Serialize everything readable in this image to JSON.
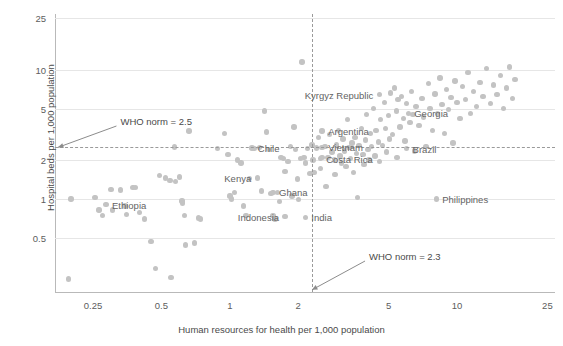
{
  "chart_data": {
    "type": "scatter",
    "title": "",
    "xlabel": "Human resources for health per 1,000 population",
    "ylabel": "Hospital beds per 1,000 population",
    "xscale": "log",
    "yscale": "log",
    "xlim": [
      0.17,
      27
    ],
    "ylim": [
      0.19,
      27
    ],
    "xticks": [
      "0.25",
      "0.5",
      "1",
      "2",
      "5",
      "10",
      "25"
    ],
    "xtick_values": [
      0.25,
      0.5,
      1,
      2,
      5,
      10,
      25
    ],
    "yticks": [
      "25",
      "10",
      "5",
      "2",
      "1",
      "0.5"
    ],
    "ytick_values": [
      25,
      10,
      5,
      2,
      1,
      0.5
    ],
    "grid": "horizontal",
    "legend": "none",
    "marker_color": "#c3c3c3",
    "text_color": "#5d5d5d",
    "gridline_color": "#e6e6e6",
    "reference_lines": [
      {
        "name": "who-norm-beds",
        "label": "WHO norm = 2.5",
        "orientation": "horizontal",
        "value": 2.5,
        "label_x": 0.33,
        "label_y": 4.0,
        "style": "dashed"
      },
      {
        "name": "who-norm-workers",
        "label": "WHO norm = 2.3",
        "orientation": "vertical",
        "value": 2.3,
        "label_x": 4.1,
        "label_y": 0.36,
        "style": "dashed"
      }
    ],
    "labeled_points": [
      {
        "name": "Kyrgyz Republic",
        "x": 4.55,
        "y": 6.4,
        "label_side": "left"
      },
      {
        "name": "Georgia",
        "x": 6.1,
        "y": 4.6,
        "label_side": "right"
      },
      {
        "name": "Argentina",
        "x": 2.55,
        "y": 3.35,
        "label_side": "right"
      },
      {
        "name": "Brazil",
        "x": 6.0,
        "y": 2.45,
        "label_side": "right"
      },
      {
        "name": "Chile",
        "x": 1.25,
        "y": 2.48,
        "label_side": "right"
      },
      {
        "name": "Vietnam",
        "x": 2.55,
        "y": 2.5,
        "label_side": "right"
      },
      {
        "name": "Costa Rica",
        "x": 2.5,
        "y": 2.05,
        "label_side": "right"
      },
      {
        "name": "Kenya",
        "x": 1.32,
        "y": 1.45,
        "label_side": "left"
      },
      {
        "name": "Ghana",
        "x": 1.55,
        "y": 1.12,
        "label_side": "right"
      },
      {
        "name": "Philippines",
        "x": 8.1,
        "y": 1.0,
        "label_side": "right"
      },
      {
        "name": "Ethiopia",
        "x": 0.285,
        "y": 0.9,
        "label_side": "right"
      },
      {
        "name": "Indonesia",
        "x": 1.75,
        "y": 0.73,
        "label_side": "left"
      },
      {
        "name": "India",
        "x": 2.15,
        "y": 0.72,
        "label_side": "right"
      }
    ],
    "points": [
      [
        0.195,
        0.24
      ],
      [
        0.2,
        1.0
      ],
      [
        0.255,
        1.02
      ],
      [
        0.265,
        0.82
      ],
      [
        0.275,
        0.74
      ],
      [
        0.3,
        1.18
      ],
      [
        0.305,
        0.82
      ],
      [
        0.33,
        1.17
      ],
      [
        0.345,
        0.88
      ],
      [
        0.35,
        0.76
      ],
      [
        0.375,
        1.23
      ],
      [
        0.385,
        1.23
      ],
      [
        0.4,
        0.78
      ],
      [
        0.42,
        0.7
      ],
      [
        0.45,
        0.47
      ],
      [
        0.47,
        0.29
      ],
      [
        0.49,
        1.52
      ],
      [
        0.52,
        1.45
      ],
      [
        0.545,
        1.38
      ],
      [
        0.55,
        0.245
      ],
      [
        0.57,
        2.52
      ],
      [
        0.575,
        1.36
      ],
      [
        0.6,
        1.48
      ],
      [
        0.615,
        0.96
      ],
      [
        0.62,
        0.93
      ],
      [
        0.63,
        0.74
      ],
      [
        0.64,
        0.44
      ],
      [
        0.66,
        3.35
      ],
      [
        0.7,
        0.455
      ],
      [
        0.73,
        0.71
      ],
      [
        0.745,
        0.7
      ],
      [
        0.88,
        2.45
      ],
      [
        0.95,
        3.2
      ],
      [
        0.98,
        2.2
      ],
      [
        1.0,
        1.05
      ],
      [
        1.02,
        1.0
      ],
      [
        1.05,
        1.12
      ],
      [
        1.08,
        2.0
      ],
      [
        1.12,
        1.9
      ],
      [
        1.15,
        0.88
      ],
      [
        1.18,
        0.74
      ],
      [
        1.22,
        1.44
      ],
      [
        1.28,
        2.45
      ],
      [
        1.35,
        2.5
      ],
      [
        1.38,
        1.15
      ],
      [
        1.42,
        4.8
      ],
      [
        1.45,
        3.3
      ],
      [
        1.48,
        2.42
      ],
      [
        1.52,
        1.1
      ],
      [
        1.55,
        0.74
      ],
      [
        1.58,
        0.7
      ],
      [
        1.62,
        1.12
      ],
      [
        1.65,
        0.95
      ],
      [
        1.68,
        2.1
      ],
      [
        1.72,
        2.05
      ],
      [
        1.75,
        1.62
      ],
      [
        1.8,
        1.95
      ],
      [
        1.85,
        2.55
      ],
      [
        1.88,
        1.05
      ],
      [
        1.92,
        3.6
      ],
      [
        1.95,
        2.4
      ],
      [
        1.98,
        1.42
      ],
      [
        2.0,
        0.99
      ],
      [
        2.05,
        2.05
      ],
      [
        2.08,
        11.5
      ],
      [
        2.12,
        2.1
      ],
      [
        2.15,
        1.9
      ],
      [
        2.2,
        2.45
      ],
      [
        2.25,
        1.58
      ],
      [
        2.3,
        2.62
      ],
      [
        2.32,
        2.0
      ],
      [
        2.35,
        1.6
      ],
      [
        2.4,
        2.48
      ],
      [
        2.45,
        3.0
      ],
      [
        2.5,
        1.72
      ],
      [
        2.55,
        2.08
      ],
      [
        2.62,
        2.55
      ],
      [
        2.65,
        1.25
      ],
      [
        2.7,
        2.1
      ],
      [
        2.75,
        3.15
      ],
      [
        2.82,
        2.3
      ],
      [
        2.88,
        2.0
      ],
      [
        2.9,
        1.55
      ],
      [
        2.95,
        2.62
      ],
      [
        3.0,
        3.4
      ],
      [
        3.05,
        2.15
      ],
      [
        3.1,
        1.9
      ],
      [
        3.15,
        2.9
      ],
      [
        3.2,
        2.35
      ],
      [
        3.25,
        1.78
      ],
      [
        3.3,
        4.1
      ],
      [
        3.35,
        2.5
      ],
      [
        3.4,
        2.05
      ],
      [
        3.45,
        2.7
      ],
      [
        3.5,
        1.6
      ],
      [
        3.55,
        3.0
      ],
      [
        3.6,
        2.25
      ],
      [
        3.65,
        1.02
      ],
      [
        3.7,
        2.6
      ],
      [
        3.8,
        3.5
      ],
      [
        3.85,
        2.2
      ],
      [
        3.9,
        1.85
      ],
      [
        3.95,
        2.85
      ],
      [
        4.0,
        4.5
      ],
      [
        4.05,
        2.4
      ],
      [
        4.1,
        2.0
      ],
      [
        4.15,
        3.2
      ],
      [
        4.2,
        2.55
      ],
      [
        4.3,
        5.0
      ],
      [
        4.35,
        2.15
      ],
      [
        4.4,
        3.4
      ],
      [
        4.5,
        2.75
      ],
      [
        4.55,
        1.95
      ],
      [
        4.6,
        4.1
      ],
      [
        4.7,
        2.6
      ],
      [
        4.8,
        5.6
      ],
      [
        4.85,
        3.5
      ],
      [
        4.9,
        2.3
      ],
      [
        5.0,
        4.4
      ],
      [
        5.05,
        2.9
      ],
      [
        5.1,
        6.6
      ],
      [
        5.2,
        3.15
      ],
      [
        5.3,
        7.2
      ],
      [
        5.4,
        4.8
      ],
      [
        5.45,
        2.1
      ],
      [
        5.5,
        5.9
      ],
      [
        5.6,
        3.6
      ],
      [
        5.7,
        6.2
      ],
      [
        5.8,
        4.2
      ],
      [
        5.9,
        2.8
      ],
      [
        6.0,
        5.5
      ],
      [
        6.2,
        3.9
      ],
      [
        6.3,
        6.8
      ],
      [
        6.4,
        4.5
      ],
      [
        6.5,
        2.35
      ],
      [
        6.6,
        5.2
      ],
      [
        6.8,
        3.7
      ],
      [
        7.0,
        6.0
      ],
      [
        7.1,
        4.3
      ],
      [
        7.3,
        2.55
      ],
      [
        7.5,
        7.8
      ],
      [
        7.6,
        5.0
      ],
      [
        7.8,
        3.4
      ],
      [
        8.0,
        6.5
      ],
      [
        8.2,
        4.6
      ],
      [
        8.4,
        8.6
      ],
      [
        8.6,
        5.4
      ],
      [
        8.8,
        3.2
      ],
      [
        9.0,
        7.0
      ],
      [
        9.2,
        4.9
      ],
      [
        9.4,
        6.1
      ],
      [
        9.6,
        2.7
      ],
      [
        9.8,
        8.2
      ],
      [
        10.0,
        5.6
      ],
      [
        10.3,
        4.2
      ],
      [
        10.6,
        7.4
      ],
      [
        10.9,
        5.9
      ],
      [
        11.2,
        9.5
      ],
      [
        11.5,
        4.6
      ],
      [
        11.8,
        6.8
      ],
      [
        12.2,
        5.2
      ],
      [
        12.6,
        8.0
      ],
      [
        13.0,
        6.2
      ],
      [
        13.5,
        10.2
      ],
      [
        14.0,
        5.5
      ],
      [
        14.5,
        7.6
      ],
      [
        15.0,
        6.4
      ],
      [
        15.5,
        9.0
      ],
      [
        16.0,
        5.0
      ],
      [
        16.5,
        7.2
      ],
      [
        17.0,
        10.5
      ],
      [
        17.5,
        6.0
      ],
      [
        18.0,
        8.4
      ]
    ]
  }
}
